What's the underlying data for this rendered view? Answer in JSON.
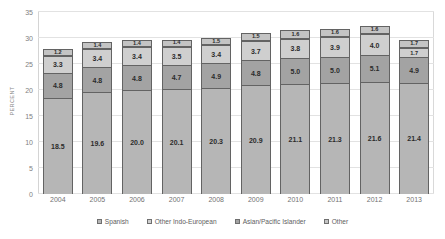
{
  "chart_data": {
    "type": "bar",
    "stacked": true,
    "title": "",
    "xlabel": "",
    "ylabel": "PERCENT",
    "ylim": [
      0,
      35
    ],
    "yticks": [
      0,
      5,
      10,
      15,
      20,
      25,
      30,
      35
    ],
    "grid": true,
    "legend_position": "bottom",
    "categories": [
      "2004",
      "2005",
      "2006",
      "2007",
      "2008",
      "2009",
      "2010",
      "2011",
      "2012",
      "2013"
    ],
    "stack_order_bottom_to_top": [
      "Spanish",
      "Asian/Pacific Islander",
      "Other Indo-European",
      "Other"
    ],
    "series": [
      {
        "name": "Spanish",
        "color": "#b6b6b6",
        "values": [
          18.5,
          19.6,
          20.0,
          20.1,
          20.3,
          20.9,
          21.1,
          21.3,
          21.6,
          21.4
        ],
        "labels": [
          "18.5",
          "19.6",
          "20.0",
          "20.1",
          "20.3",
          "20.9",
          "21.1",
          "21.3",
          "21.6",
          "21.4"
        ]
      },
      {
        "name": "Asian/Pacific Islander",
        "color": "#a3a3a3",
        "values": [
          4.8,
          4.8,
          4.8,
          4.7,
          4.9,
          4.8,
          5.0,
          5.0,
          5.1,
          4.9
        ],
        "labels": [
          "4.8",
          "4.8",
          "4.8",
          "4.7",
          "4.9",
          "4.8",
          "5.0",
          "5.0",
          "5.1",
          "4.9"
        ]
      },
      {
        "name": "Other Indo-European",
        "color": "#cfcfcf",
        "values": [
          3.3,
          3.4,
          3.4,
          3.5,
          3.4,
          3.7,
          3.8,
          3.9,
          4.0,
          1.7
        ],
        "labels": [
          "3.3",
          "3.4",
          "3.4",
          "3.5",
          "3.4",
          "3.7",
          "3.8",
          "3.9",
          "4.0",
          "1.7"
        ]
      },
      {
        "name": "Other",
        "color": "#c4c4c4",
        "values": [
          1.2,
          1.4,
          1.4,
          1.4,
          1.5,
          1.5,
          1.6,
          1.6,
          1.6,
          1.7
        ],
        "labels": [
          "1.2",
          "1.4",
          "1.4",
          "1.4",
          "1.5",
          "1.5",
          "1.6",
          "1.6",
          "1.6",
          "1.7"
        ]
      }
    ],
    "totals": [
      27.8,
      29.2,
      29.6,
      29.7,
      30.1,
      30.9,
      31.5,
      31.8,
      32.3,
      29.7
    ]
  },
  "legend": {
    "items": [
      {
        "label": "Spanish",
        "color": "#b6b6b6"
      },
      {
        "label": "Other Indo-European",
        "color": "#cfcfcf"
      },
      {
        "label": "Asian/Pacific Islander",
        "color": "#a3a3a3"
      },
      {
        "label": "Other",
        "color": "#c4c4c4"
      }
    ]
  },
  "axis": {
    "y_title": "PERCENT"
  }
}
